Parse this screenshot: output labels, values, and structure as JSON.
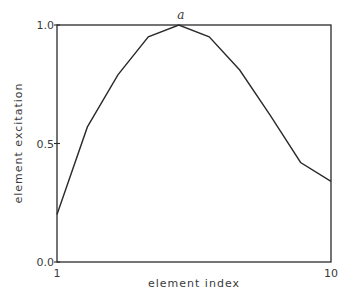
{
  "chart_data": {
    "type": "line",
    "title": "",
    "annotation": "a",
    "xlabel": "element index",
    "ylabel": "element excitation",
    "xlim": [
      1,
      10
    ],
    "ylim": [
      0.0,
      1.0
    ],
    "x_ticks": [
      "1",
      "10"
    ],
    "y_ticks": [
      "0.0",
      "0.5",
      "1.0"
    ],
    "grid": false,
    "legend": null,
    "series": [
      {
        "name": "excitation",
        "x": [
          1,
          2,
          3,
          4,
          5,
          6,
          7,
          8,
          9,
          10
        ],
        "values": [
          0.2,
          0.57,
          0.79,
          0.95,
          1.0,
          0.95,
          0.81,
          0.62,
          0.42,
          0.34
        ]
      }
    ],
    "colors": {
      "line": "#2a2a2a",
      "frame": "#2a2a2a",
      "background": "#ffffff"
    }
  }
}
